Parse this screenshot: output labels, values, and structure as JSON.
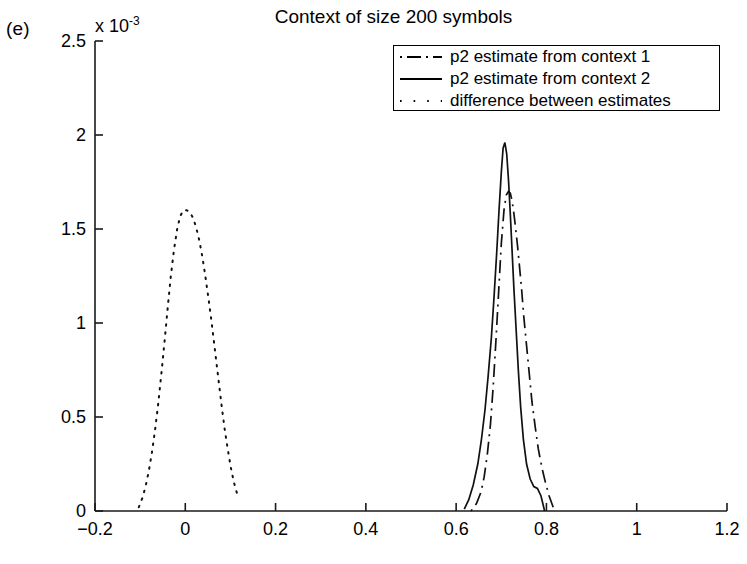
{
  "figure": {
    "panel_label": "(e)",
    "title": "Context of size 200 symbols",
    "y_exponent_prefix": "x 10",
    "y_exponent_power": "-3"
  },
  "legend": {
    "entries": [
      {
        "label": "p2 estimate from context 1",
        "style": "dash-dot"
      },
      {
        "label": "p2 estimate from context 2",
        "style": "solid"
      },
      {
        "label": "difference between estimates",
        "style": "dotted"
      }
    ]
  },
  "axes": {
    "x_ticks": [
      "-0.2",
      "0",
      "0.2",
      "0.4",
      "0.6",
      "0.8",
      "1",
      "1.2"
    ],
    "y_ticks": [
      "0",
      "0.5",
      "1",
      "1.5",
      "2",
      "2.5"
    ]
  },
  "chart_data": {
    "type": "line",
    "title": "Context of size 200 symbols",
    "xlabel": "",
    "ylabel": "",
    "y_scale_factor": "1e-3",
    "xlim": [
      -0.2,
      1.2
    ],
    "ylim": [
      0,
      0.0025
    ],
    "grid": false,
    "legend_position": "top-right",
    "series": [
      {
        "name": "p2 estimate from context 1",
        "style": "dash-dot",
        "x": [
          0.633,
          0.645,
          0.655,
          0.662,
          0.669,
          0.676,
          0.682,
          0.688,
          0.694,
          0.7,
          0.706,
          0.711,
          0.716,
          0.72,
          0.724,
          0.728,
          0.732,
          0.736,
          0.74,
          0.745,
          0.75,
          0.756,
          0.762,
          0.768,
          0.775,
          0.782,
          0.79,
          0.798,
          0.806,
          0.815
        ],
        "y": [
          0.0,
          4e-05,
          0.0001,
          0.00018,
          0.0003,
          0.00046,
          0.00066,
          0.0009,
          0.00116,
          0.00142,
          0.0016,
          0.00168,
          0.0017,
          0.00169,
          0.00165,
          0.00158,
          0.0015,
          0.00141,
          0.00131,
          0.00118,
          0.00103,
          0.00088,
          0.00073,
          0.00058,
          0.00045,
          0.00033,
          0.00023,
          0.00015,
          8e-05,
          2e-05
        ]
      },
      {
        "name": "p2 estimate from context 2",
        "style": "solid",
        "x": [
          0.618,
          0.628,
          0.638,
          0.648,
          0.656,
          0.664,
          0.671,
          0.678,
          0.684,
          0.69,
          0.695,
          0.7,
          0.704,
          0.708,
          0.712,
          0.716,
          0.72,
          0.724,
          0.728,
          0.733,
          0.738,
          0.743,
          0.749,
          0.756,
          0.764,
          0.772,
          0.78,
          0.788,
          0.796
        ],
        "y": [
          1e-05,
          6e-05,
          0.00014,
          0.00025,
          0.00038,
          0.00054,
          0.00072,
          0.00092,
          0.00114,
          0.00138,
          0.0016,
          0.0018,
          0.00193,
          0.00196,
          0.0019,
          0.00176,
          0.00158,
          0.00138,
          0.00118,
          0.00096,
          0.00074,
          0.00055,
          0.00038,
          0.00025,
          0.00017,
          0.00013,
          0.00012,
          8e-05,
          0.0
        ]
      },
      {
        "name": "difference between estimates",
        "style": "dotted",
        "x": [
          -0.103,
          -0.095,
          -0.088,
          -0.081,
          -0.074,
          -0.067,
          -0.06,
          -0.053,
          -0.046,
          -0.039,
          -0.032,
          -0.025,
          -0.018,
          -0.011,
          -0.004,
          0.003,
          0.01,
          0.017,
          0.024,
          0.031,
          0.038,
          0.045,
          0.052,
          0.059,
          0.066,
          0.073,
          0.08,
          0.087,
          0.094,
          0.101,
          0.108,
          0.115,
          0.122
        ],
        "y": [
          2e-05,
          7e-05,
          0.00013,
          0.00021,
          0.00031,
          0.00043,
          0.00057,
          0.00073,
          0.0009,
          0.00108,
          0.00125,
          0.00139,
          0.0015,
          0.00157,
          0.0016,
          0.0016,
          0.00159,
          0.00156,
          0.00151,
          0.00144,
          0.00135,
          0.00124,
          0.00112,
          0.00099,
          0.00085,
          0.00071,
          0.00057,
          0.00044,
          0.00033,
          0.00023,
          0.00015,
          9e-05,
          0.0001
        ]
      }
    ]
  }
}
